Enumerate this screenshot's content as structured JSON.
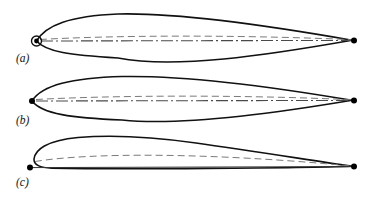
{
  "figure": {
    "type": "technical-diagram",
    "background_color": "#ffffff",
    "outline_color": "#111111",
    "centerline_color": "#555555",
    "camberline_color": "#777777",
    "marker_color": "#000000",
    "panels": [
      {
        "id": "a",
        "label": "(a)",
        "label_x": 16,
        "label_y": 62,
        "description": "symmetric-airfoil-rounded-leading-edge",
        "chord_left_x": 36,
        "chord_right_x": 354,
        "chord_y": 41,
        "max_thickness_x": 118,
        "upper_peak_y": 14,
        "lower_peak_y": 58,
        "leading_edge_circle": {
          "cx": 36.5,
          "cy": 41,
          "r": 5.0,
          "dot_r": 2.4
        },
        "trailing_edge_dot": {
          "cx": 354,
          "cy": 41,
          "r": 3.0
        },
        "camber_line_offset": -4.5,
        "has_leading_circle": true,
        "has_chord_dash_dot": true,
        "has_camber_dashed": true
      },
      {
        "id": "b",
        "label": "(b)",
        "label_x": 16,
        "label_y": 124,
        "description": "symmetric-airfoil-sharp-leading-edge",
        "chord_left_x": 32,
        "chord_right_x": 354,
        "chord_y": 101,
        "max_thickness_x": 122,
        "upper_peak_y": 76,
        "lower_peak_y": 120,
        "leading_edge_dot": {
          "cx": 32,
          "cy": 101,
          "r": 3.0
        },
        "trailing_edge_dot": {
          "cx": 354,
          "cy": 101,
          "r": 3.0
        },
        "camber_line_offset": -4.0,
        "has_leading_circle": false,
        "has_chord_dash_dot": true,
        "has_camber_dashed": true
      },
      {
        "id": "c",
        "label": "(c)",
        "label_x": 16,
        "label_y": 186,
        "description": "cambered-airfoil-flat-lower-surface",
        "chord_left_x": 30,
        "chord_right_x": 354,
        "chord_y": 167,
        "max_thickness_x": 120,
        "upper_peak_y": 136,
        "lower_peak_y": 169,
        "leading_edge_dot": {
          "cx": 30,
          "cy": 167,
          "r": 3.0
        },
        "trailing_edge_dot": {
          "cx": 354,
          "cy": 167,
          "r": 3.0
        },
        "camber_line_offset": -10.0,
        "nose_top_y": 150,
        "has_leading_circle": false,
        "has_chord_dash_dot": false,
        "has_camber_dashed": true
      }
    ],
    "line_styles": {
      "outline_width": 1.6,
      "chord_dash_pattern": "12 3 2 3",
      "camber_dash_pattern": "7 4",
      "chord_width": 1.0,
      "camber_width": 1.0
    }
  }
}
